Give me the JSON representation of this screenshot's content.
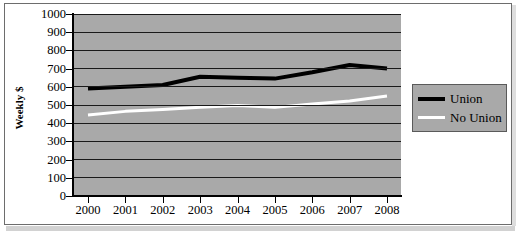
{
  "chart_data": {
    "type": "line",
    "title": "",
    "subtitle": "",
    "xlabel": "",
    "ylabel": "Weekly $",
    "categories": [
      "2000",
      "2001",
      "2002",
      "2003",
      "2004",
      "2005",
      "2006",
      "2007",
      "2008"
    ],
    "x": [
      2000,
      2001,
      2002,
      2003,
      2004,
      2005,
      2006,
      2007,
      2008
    ],
    "ylim": [
      0,
      1000
    ],
    "yticks": [
      0,
      100,
      200,
      300,
      400,
      500,
      600,
      700,
      800,
      900,
      1000
    ],
    "ytick_labels": [
      "0",
      "100",
      "200",
      "300",
      "400",
      "500",
      "600",
      "700",
      "800",
      "900",
      "1000"
    ],
    "grid": "horizontal",
    "legend_position": "right",
    "plot_background": "#a9a9a9",
    "series": [
      {
        "name": "Union",
        "color": "#000000",
        "line_width": 4,
        "values": [
          590,
          600,
          610,
          655,
          650,
          645,
          680,
          720,
          700
        ]
      },
      {
        "name": "No Union",
        "color": "#ffffff",
        "line_width": 3,
        "values": [
          445,
          465,
          475,
          487,
          497,
          487,
          505,
          522,
          550
        ]
      }
    ]
  },
  "legend": {
    "items": [
      {
        "label": "Union",
        "color": "#000000"
      },
      {
        "label": "No Union",
        "color": "#ffffff"
      }
    ]
  },
  "axes": {
    "y_title": "Weekly $"
  }
}
